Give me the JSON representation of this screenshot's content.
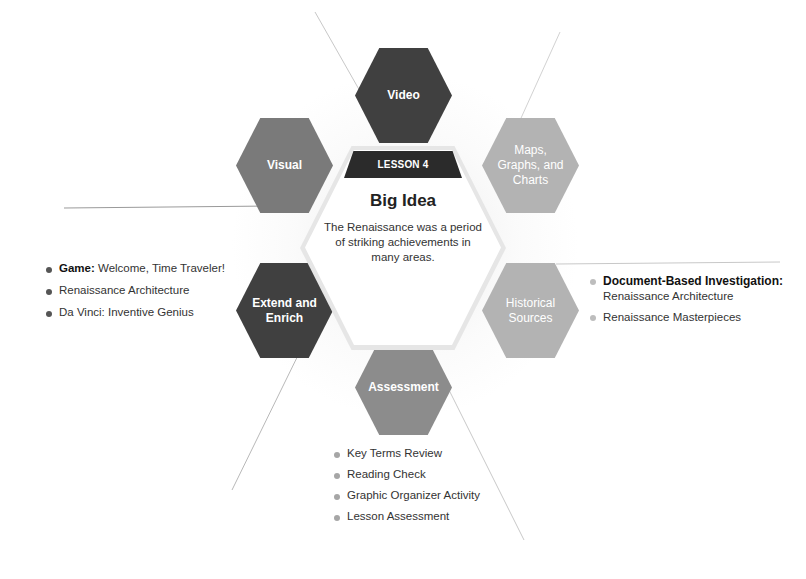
{
  "diagram": {
    "banner": "LESSON 4",
    "title": "Big Idea",
    "big_idea": "The Renaissance was a period of striking achievements in many areas.",
    "hexagons": {
      "video": {
        "label": "Video",
        "color": "#404040"
      },
      "visual": {
        "label": "Visual",
        "color": "#7a7a7a"
      },
      "maps": {
        "label": "Maps, Graphs, and Charts",
        "color": "#b3b3b3"
      },
      "extend": {
        "label": "Extend and Enrich",
        "color": "#404040"
      },
      "historical": {
        "label": "Historical Sources",
        "color": "#b3b3b3"
      },
      "assessment": {
        "label": "Assessment",
        "color": "#8c8c8c"
      }
    },
    "extend_list": [
      {
        "bold": "Game:",
        "text": " Welcome, Time Traveler!"
      },
      {
        "bold": "",
        "text": "Renaissance Architecture"
      },
      {
        "bold": "",
        "text": "Da Vinci: Inventive Genius"
      }
    ],
    "historical_list": [
      {
        "bold": "Document-Based Investigation:",
        "text": "Renaissance Architecture"
      },
      {
        "bold": "",
        "text": "Renaissance Masterpieces"
      }
    ],
    "assessment_list": [
      {
        "text": "Key Terms Review"
      },
      {
        "text": "Reading Check"
      },
      {
        "text": "Graphic Organizer Activity"
      },
      {
        "text": "Lesson Assessment"
      }
    ]
  }
}
